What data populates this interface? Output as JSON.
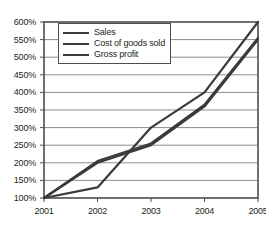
{
  "chart_data": {
    "type": "line",
    "title": "",
    "xlabel": "",
    "ylabel": "",
    "categories": [
      "2001",
      "2002",
      "2003",
      "2004",
      "2005"
    ],
    "x_tick_labels": [
      "2001",
      "2002",
      "2003",
      "2004",
      "2005"
    ],
    "y_tick_labels": [
      "100%",
      "150%",
      "200%",
      "250%",
      "300%",
      "350%",
      "400%",
      "450%",
      "500%",
      "550%",
      "600%"
    ],
    "y_tick_values": [
      100,
      150,
      200,
      250,
      300,
      350,
      400,
      450,
      500,
      550,
      600
    ],
    "ylim": [
      100,
      600
    ],
    "y_unit": "%",
    "grid": true,
    "grid_axis": "y",
    "legend_position": "top-left",
    "series": [
      {
        "name": "Sales",
        "values": [
          100,
          200,
          250,
          360,
          550
        ],
        "color": "#3a3a3a"
      },
      {
        "name": "Cost of goods sold",
        "values": [
          100,
          205,
          255,
          365,
          555
        ],
        "color": "#3a3a3a"
      },
      {
        "name": "Gross profit",
        "values": [
          100,
          130,
          300,
          400,
          600
        ],
        "color": "#3a3a3a"
      }
    ]
  },
  "legend": {
    "items": [
      {
        "label": "Sales"
      },
      {
        "label": "Cost of goods sold"
      },
      {
        "label": "Gross profit"
      }
    ]
  },
  "colors": {
    "line": "#3a3a3a",
    "grid": "#8c8c8c",
    "axis": "#4d4d4d",
    "text": "#231f20",
    "background": "#ffffff"
  }
}
